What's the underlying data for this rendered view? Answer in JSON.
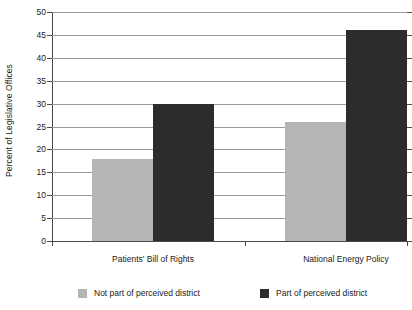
{
  "chart_data": {
    "type": "bar",
    "title": "",
    "xlabel": "",
    "ylabel": "Percent of Legislative Offices",
    "ylim": [
      0,
      50
    ],
    "ytick_step": 5,
    "yticks": [
      50,
      45,
      40,
      35,
      30,
      25,
      20,
      15,
      10,
      5,
      0
    ],
    "grid": true,
    "legend_position": "bottom",
    "categories": [
      "Patients' Bill of Rights",
      "National Energy Policy"
    ],
    "series": [
      {
        "name": "Not part of perceived district",
        "color": "#b5b5b5",
        "values": [
          18,
          26
        ]
      },
      {
        "name": "Part of perceived district",
        "color": "#2c2c2c",
        "values": [
          30,
          46
        ]
      }
    ]
  },
  "axis": {
    "y_title": "Percent of Legislative Offices"
  },
  "colors": {
    "light_gray": "#b5b5b5",
    "dark_gray": "#2c2c2c",
    "gridline": "#9a9a9a",
    "axis": "#4a4a4a",
    "background": "#ffffff"
  }
}
